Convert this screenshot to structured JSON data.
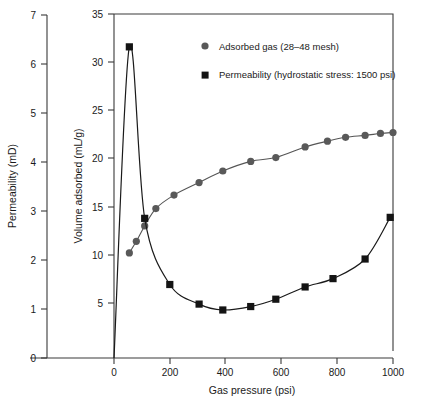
{
  "chart_data": {
    "type": "scatter",
    "title": "",
    "xlabel": "Gas pressure (psi)",
    "ylabel_left": "Permeability (mD)",
    "ylabel_inner": "Volume adsorbed (mL/g)",
    "xlim": [
      0,
      1100
    ],
    "xticks": [
      0,
      200,
      400,
      600,
      800,
      1000
    ],
    "xticklabels": [
      "0",
      "200",
      "400",
      "600",
      "800",
      "1000"
    ],
    "ylim_left": [
      0,
      7
    ],
    "yticks_left": [
      0,
      1,
      2,
      3,
      4,
      5,
      6,
      7
    ],
    "yticklabels_left": [
      "0",
      "1",
      "2",
      "3",
      "4",
      "5",
      "6",
      "7"
    ],
    "ylim_inner": [
      0,
      35
    ],
    "yticks_inner": [
      5,
      10,
      15,
      20,
      25,
      30,
      35
    ],
    "yticklabels_inner": [
      "5",
      "10",
      "15",
      "20",
      "25",
      "30",
      "35"
    ],
    "grid": false,
    "legend_position": "upper-center",
    "series": [
      {
        "name": "Adsorbed gas (28–48 mesh)",
        "marker": "circle",
        "color": "#595959",
        "axis": "inner",
        "x": [
          55,
          80,
          110,
          150,
          215,
          305,
          390,
          490,
          580,
          685,
          765,
          830,
          900,
          955,
          1000
        ],
        "y": [
          10.2,
          11.4,
          13.0,
          14.8,
          16.2,
          17.5,
          18.7,
          19.7,
          20.1,
          21.2,
          21.8,
          22.2,
          22.4,
          22.6,
          22.7
        ]
      },
      {
        "name": "Permeability (hydrostatic stress: 1500 psi)",
        "marker": "square",
        "color": "#141414",
        "axis": "left",
        "x": [
          55,
          110,
          200,
          305,
          390,
          490,
          580,
          685,
          785,
          900,
          990
        ],
        "y": [
          6.35,
          2.85,
          1.5,
          1.1,
          0.98,
          1.05,
          1.2,
          1.45,
          1.62,
          2.02,
          2.87
        ]
      }
    ]
  },
  "axes": {
    "left_axis_name": "permeability-axis",
    "inner_axis_name": "volume-adsorbed-axis",
    "x_axis_name": "gas-pressure-axis"
  },
  "legend": {
    "entries": [
      {
        "label": "Adsorbed gas (28–48 mesh)",
        "marker": "circle",
        "color": "#595959"
      },
      {
        "label": "Permeability (hydrostatic stress: 1500 psi)",
        "marker": "square",
        "color": "#141414"
      }
    ]
  },
  "colors": {
    "adsorbed_gas": "#595959",
    "permeability": "#141414",
    "axis": "#3a3a3a",
    "background": "#ffffff"
  }
}
